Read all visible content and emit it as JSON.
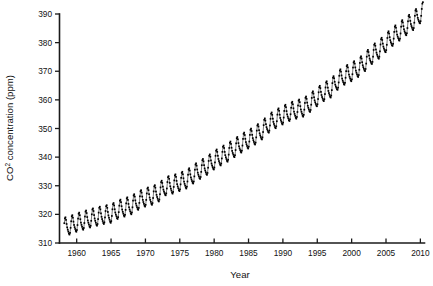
{
  "chart_data": {
    "type": "line",
    "title": "",
    "xlabel": "Year",
    "ylabel": "CO2 concentration (ppm)",
    "ylabel_prefix": "CO",
    "ylabel_superscript": "2",
    "ylabel_suffix": " concentration (ppm)",
    "xlim": [
      1957.5,
      2010.6
    ],
    "ylim": [
      310,
      390
    ],
    "xticks": [
      1960,
      1965,
      1970,
      1975,
      1980,
      1985,
      1990,
      1995,
      2000,
      2005,
      2010
    ],
    "yticks": [
      310,
      320,
      330,
      340,
      350,
      360,
      370,
      380,
      390
    ],
    "xtick_labels": [
      "1960",
      "1965",
      "1970",
      "1975",
      "1980",
      "1985",
      "1990",
      "1995",
      "2000",
      "2005",
      "2010"
    ],
    "ytick_labels": [
      "310",
      "320",
      "330",
      "340",
      "350",
      "360",
      "370",
      "380",
      "390"
    ],
    "grid": false,
    "legend": null,
    "marker": "square",
    "marker_color": "#000000",
    "line_color": "#111111",
    "series_name": "Monthly mean CO2 concentration",
    "seasonal_amplitude_ppm": 3.0,
    "annual_trend": {
      "years": [
        1958,
        1959,
        1960,
        1961,
        1962,
        1963,
        1964,
        1965,
        1966,
        1967,
        1968,
        1969,
        1970,
        1971,
        1972,
        1973,
        1974,
        1975,
        1976,
        1977,
        1978,
        1979,
        1980,
        1981,
        1982,
        1983,
        1984,
        1985,
        1986,
        1987,
        1988,
        1989,
        1990,
        1991,
        1992,
        1993,
        1994,
        1995,
        1996,
        1997,
        1998,
        1999,
        2000,
        2001,
        2002,
        2003,
        2004,
        2005,
        2006,
        2007,
        2008,
        2009,
        2010
      ],
      "values": [
        315.3,
        315.9,
        316.9,
        317.6,
        318.4,
        319.0,
        319.6,
        320.0,
        321.4,
        322.2,
        323.0,
        324.6,
        325.7,
        326.3,
        327.5,
        329.7,
        330.2,
        331.1,
        332.0,
        333.8,
        335.4,
        336.8,
        338.7,
        340.1,
        341.4,
        343.0,
        344.6,
        346.0,
        347.4,
        349.2,
        351.6,
        353.1,
        354.4,
        355.6,
        356.4,
        357.1,
        358.8,
        360.8,
        362.6,
        363.8,
        366.6,
        368.3,
        369.5,
        371.0,
        373.1,
        375.6,
        377.4,
        379.7,
        381.9,
        383.7,
        385.6,
        387.4,
        389.8
      ]
    }
  },
  "figure": {
    "background": "#ffffff",
    "axis_color": "#1a1a1a"
  }
}
